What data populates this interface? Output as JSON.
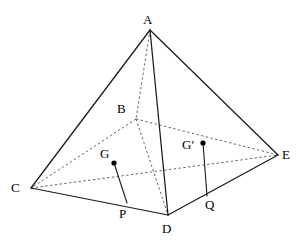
{
  "figure": {
    "width": 297,
    "height": 252,
    "background_color": "#ffffff",
    "stroke_color": "#1a1a1a",
    "hidden_stroke_color": "#555555"
  },
  "labels": {
    "A": "A",
    "B": "B",
    "C": "C",
    "D": "D",
    "E": "E",
    "G": "G",
    "Gprime": "G′",
    "P": "P",
    "Q": "Q"
  },
  "points": {
    "A": {
      "x": 150,
      "y": 30,
      "label_x": 143,
      "label_y": 13
    },
    "B": {
      "x": 136,
      "y": 119,
      "label_x": 117,
      "label_y": 102
    },
    "C": {
      "x": 31,
      "y": 188,
      "label_x": 11,
      "label_y": 181
    },
    "D": {
      "x": 168,
      "y": 215,
      "label_x": 162,
      "label_y": 222
    },
    "E": {
      "x": 278,
      "y": 155,
      "label_x": 282,
      "label_y": 148
    },
    "G": {
      "x": 114,
      "y": 163,
      "label_x": 100,
      "label_y": 147
    },
    "Gprime": {
      "x": 203,
      "y": 143,
      "label_x": 182,
      "label_y": 138
    },
    "P": {
      "x": 127,
      "y": 203,
      "label_x": 119,
      "label_y": 207
    },
    "Q": {
      "x": 207,
      "y": 196,
      "label_x": 205,
      "label_y": 198
    }
  },
  "edges": [
    {
      "name": "A-C",
      "from": "A",
      "to": "C",
      "style": "solid"
    },
    {
      "name": "A-E",
      "from": "A",
      "to": "E",
      "style": "solid"
    },
    {
      "name": "A-D",
      "from": "A",
      "to": "D",
      "style": "solid"
    },
    {
      "name": "A-B",
      "from": "A",
      "to": "B",
      "style": "dashed"
    },
    {
      "name": "B-C",
      "from": "B",
      "to": "C",
      "style": "dashed"
    },
    {
      "name": "B-E",
      "from": "B",
      "to": "E",
      "style": "dashed"
    },
    {
      "name": "B-D",
      "from": "B",
      "to": "D",
      "style": "dashed"
    },
    {
      "name": "C-D",
      "from": "C",
      "to": "D",
      "style": "solid"
    },
    {
      "name": "D-E",
      "from": "D",
      "to": "E",
      "style": "solid"
    },
    {
      "name": "C-E",
      "from": "C",
      "to": "E",
      "style": "dashed"
    }
  ],
  "segments": [
    {
      "name": "G-P",
      "from": "G",
      "to": "P",
      "style": "solid"
    },
    {
      "name": "Gprime-Q",
      "from": "Gprime",
      "to": "Q",
      "style": "solid"
    }
  ],
  "dots": [
    {
      "name": "point-G",
      "at": "G",
      "radius": 2.6
    },
    {
      "name": "point-Gprime",
      "at": "Gprime",
      "radius": 2.6
    }
  ]
}
